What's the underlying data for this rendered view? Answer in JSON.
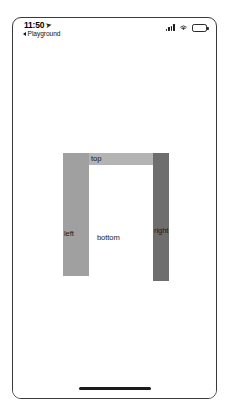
{
  "status_bar": {
    "time": "11:50",
    "location_arrow": "location-arrow",
    "back_label": "Playground",
    "signal_icon": "cellular-signal-icon",
    "wifi_icon": "wifi-icon",
    "battery_icon": "battery-icon"
  },
  "layout_demo": {
    "views": [
      {
        "name": "top",
        "label": "top",
        "color": "#b4b4b4"
      },
      {
        "name": "left",
        "label": "left",
        "color": "#a0a0a0"
      },
      {
        "name": "bottom",
        "label": "bottom",
        "color": "#ffffff"
      },
      {
        "name": "right",
        "label": "right",
        "color": "#6e6e6e"
      }
    ]
  },
  "home_indicator": "home-indicator"
}
